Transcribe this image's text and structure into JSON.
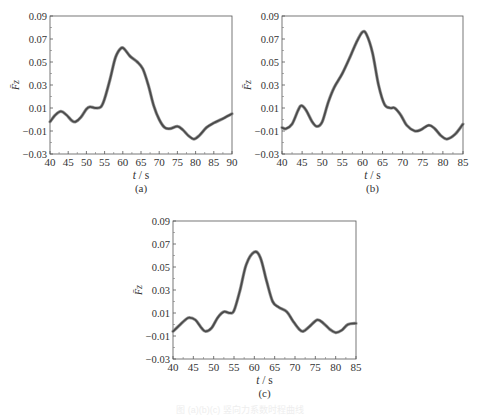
{
  "chart_data": [
    {
      "id": "a",
      "type": "line",
      "panel_label": "(a)",
      "xlabel": "t / s",
      "ylabel": "F̄z",
      "xlim": [
        40,
        90
      ],
      "ylim": [
        -0.03,
        0.09
      ],
      "xticks": [
        40,
        45,
        50,
        55,
        60,
        65,
        70,
        75,
        80,
        85,
        90
      ],
      "yticks": [
        -0.03,
        -0.01,
        0.01,
        0.03,
        0.05,
        0.07,
        0.09
      ],
      "ytick_labels": [
        "−0.03",
        "−0.01",
        "0.01",
        "0.03",
        "0.05",
        "0.07",
        "0.09"
      ],
      "grid": false,
      "series": [
        {
          "name": "F̄z",
          "x": [
            40,
            41.5,
            43,
            44.5,
            46,
            47,
            48.5,
            50,
            51,
            52.5,
            54,
            55,
            56.5,
            58,
            59.5,
            60.5,
            62,
            64,
            65.5,
            67,
            68.5,
            70,
            71.5,
            73,
            75,
            76.5,
            78,
            79.5,
            81,
            83,
            85,
            87,
            90
          ],
          "y": [
            -0.002,
            0.004,
            0.007,
            0.004,
            -0.001,
            -0.002,
            0.002,
            0.009,
            0.011,
            0.01,
            0.011,
            0.018,
            0.035,
            0.054,
            0.062,
            0.061,
            0.055,
            0.05,
            0.044,
            0.03,
            0.012,
            0.0,
            -0.007,
            -0.008,
            -0.006,
            -0.009,
            -0.014,
            -0.017,
            -0.014,
            -0.007,
            -0.003,
            0.0,
            0.005
          ]
        }
      ]
    },
    {
      "id": "b",
      "type": "line",
      "panel_label": "(b)",
      "xlabel": "t / s",
      "ylabel": "F̄z",
      "xlim": [
        40,
        85
      ],
      "ylim": [
        -0.03,
        0.09
      ],
      "xticks": [
        40,
        45,
        50,
        55,
        60,
        65,
        70,
        75,
        80,
        85
      ],
      "yticks": [
        -0.03,
        -0.01,
        0.01,
        0.03,
        0.05,
        0.07,
        0.09
      ],
      "ytick_labels": [
        "−0.03",
        "−0.01",
        "0.01",
        "0.03",
        "0.05",
        "0.07",
        "0.09"
      ],
      "grid": false,
      "series": [
        {
          "name": "F̄z",
          "x": [
            40,
            41,
            42.5,
            44,
            44.8,
            46,
            47.5,
            48.7,
            50,
            51.5,
            53,
            55,
            57,
            58.5,
            60,
            61,
            62.5,
            64,
            65.5,
            67,
            68,
            69.5,
            71,
            73,
            74.5,
            76.5,
            78,
            79.5,
            81,
            83,
            85
          ],
          "y": [
            -0.007,
            -0.008,
            -0.004,
            0.008,
            0.012,
            0.008,
            -0.002,
            -0.006,
            -0.002,
            0.015,
            0.028,
            0.04,
            0.055,
            0.067,
            0.076,
            0.074,
            0.058,
            0.03,
            0.013,
            0.01,
            0.01,
            0.004,
            -0.005,
            -0.01,
            -0.009,
            -0.005,
            -0.008,
            -0.014,
            -0.017,
            -0.013,
            -0.004
          ]
        }
      ]
    },
    {
      "id": "c",
      "type": "line",
      "panel_label": "(c)",
      "xlabel": "t / s",
      "ylabel": "F̄z",
      "xlim": [
        40,
        85
      ],
      "ylim": [
        -0.03,
        0.09
      ],
      "xticks": [
        40,
        45,
        50,
        55,
        60,
        65,
        70,
        75,
        80,
        85
      ],
      "yticks": [
        -0.03,
        -0.01,
        0.01,
        0.03,
        0.05,
        0.07,
        0.09
      ],
      "ytick_labels": [
        "−0.03",
        "−0.01",
        "0.01",
        "0.03",
        "0.05",
        "0.07",
        "0.09"
      ],
      "grid": false,
      "series": [
        {
          "name": "F̄z",
          "x": [
            40,
            41.5,
            43,
            44,
            45.5,
            47,
            48,
            49.5,
            51,
            52.5,
            54,
            55,
            56.5,
            58,
            60,
            61.5,
            63,
            64.5,
            66,
            68,
            69.5,
            71,
            72,
            73.5,
            75.5,
            77,
            78.5,
            80,
            81.5,
            83,
            85
          ],
          "y": [
            -0.006,
            -0.001,
            0.004,
            0.006,
            0.004,
            -0.003,
            -0.006,
            -0.003,
            0.006,
            0.011,
            0.01,
            0.012,
            0.03,
            0.052,
            0.063,
            0.058,
            0.038,
            0.02,
            0.015,
            0.011,
            0.003,
            -0.004,
            -0.006,
            -0.002,
            0.004,
            0.001,
            -0.004,
            -0.007,
            -0.005,
            0.0,
            0.001
          ]
        }
      ]
    }
  ],
  "caption": "图 (a)(b)(c) 竖向力系数时程曲线"
}
